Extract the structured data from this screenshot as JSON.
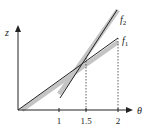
{
  "diagram": {
    "title": "",
    "axes": {
      "x_label": "θ",
      "y_label": "z",
      "x_ticks": [
        {
          "value": 1,
          "label": "1"
        },
        {
          "value": 1.5,
          "label": "1.5"
        },
        {
          "value": 2,
          "label": "2"
        }
      ]
    },
    "curves": [
      {
        "name": "f1",
        "label_base": "f",
        "label_sub": "1",
        "description": "exact function, lower slope"
      },
      {
        "name": "f2",
        "label_base": "f",
        "label_sub": "2",
        "description": "exact function, steeper slope"
      }
    ],
    "annotations": {
      "intersection_theta": 1.5,
      "dashed_guides": [
        1.5,
        2
      ],
      "gray_bands": "linear approximations (tangent segments) overlaid on f1 and f2"
    },
    "colors": {
      "line": "#222222",
      "band": "#c4c4c4",
      "axis": "#222222"
    }
  }
}
